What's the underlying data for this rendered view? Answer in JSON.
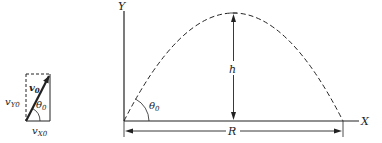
{
  "vector_diagram": {
    "velocity_label": "v",
    "velocity_sub": "0",
    "vy_label": "v",
    "vy_sub": "Y0",
    "vx_label": "v",
    "vx_sub": "X0",
    "angle_label": "θ",
    "angle_sub": "0"
  },
  "trajectory_diagram": {
    "y_axis_label": "Y",
    "x_axis_label": "X",
    "height_label": "h",
    "range_label": "R",
    "angle_label": "θ",
    "angle_sub": "0"
  },
  "colors": {
    "ink": "#222222",
    "background": "#ffffff"
  }
}
